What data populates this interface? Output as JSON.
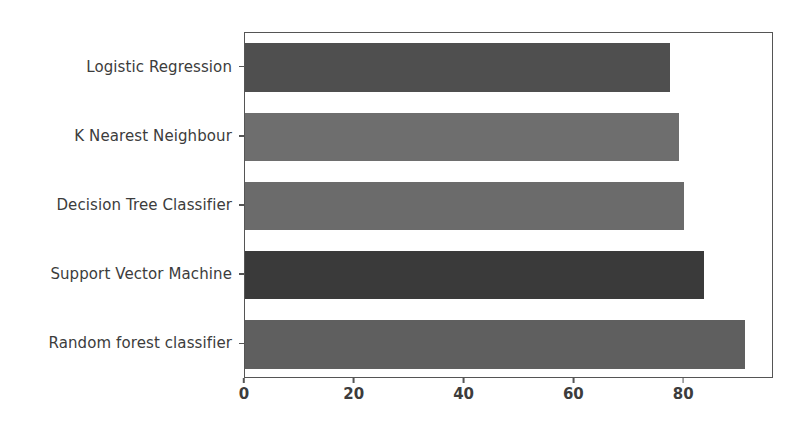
{
  "chart_data": {
    "type": "bar",
    "orientation": "horizontal",
    "title": "",
    "xlabel": "",
    "ylabel": "",
    "categories": [
      "Logistic Regression",
      "K Nearest Neighbour",
      "Decision Tree Classifier",
      "Support Vector Machine",
      "Random forest classifier"
    ],
    "values": [
      77.5,
      79.0,
      80.0,
      83.7,
      91.0
    ],
    "bar_colors": [
      "#4f4f4f",
      "#6e6e6e",
      "#6b6b6b",
      "#3a3a3a",
      "#5f5f5f"
    ],
    "xlim": [
      0,
      96
    ],
    "ylim": [
      -0.5,
      4.5
    ],
    "xticks": [
      0,
      20,
      40,
      60,
      80
    ],
    "xtick_labels": [
      "0",
      "20",
      "40",
      "60",
      "80"
    ],
    "ytick_labels": [
      "Logistic Regression",
      "K Nearest Neighbour",
      "Decision Tree Classifier",
      "Support Vector Machine",
      "Random forest classifier"
    ],
    "grid": false,
    "legend": null,
    "spine_color": "#555555",
    "background_color": "#ffffff"
  },
  "axes": {
    "x_tick_0": "0",
    "x_tick_1": "20",
    "x_tick_2": "40",
    "x_tick_3": "60",
    "x_tick_4": "80"
  }
}
